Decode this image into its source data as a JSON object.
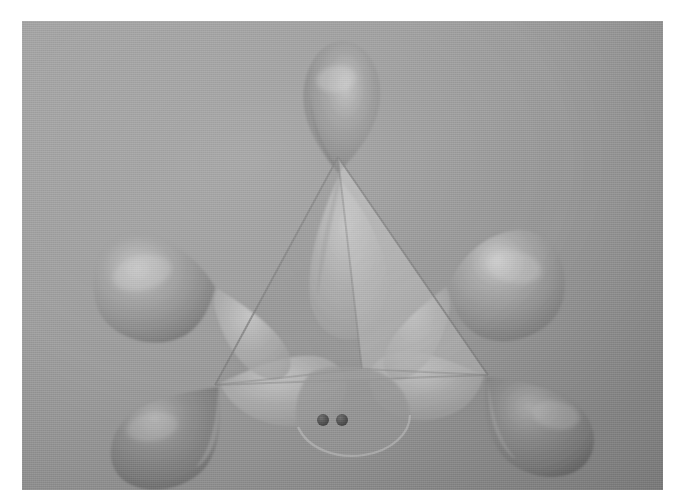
{
  "figure": {
    "alt_description": "Grayscale rendering of four sp3 hybrid orbitals directed toward the corners of a translucent tetrahedron, with a lone pair of electrons shown as two dots in the front lobe",
    "background_color": "#9b9b9b",
    "frame_margin_px": 21,
    "lobe_color": "#8d8d8d",
    "lobe_highlight_color": "#cfcfcf",
    "lobe_shadow_color": "#6f6f6f",
    "tetrahedron_face_color": "#b4b4b4",
    "tetrahedron_edge_color": "#7c7c7c",
    "electron_dot_color": "#4b4b4b",
    "electron_dot_count": 2,
    "lobe_count": 4,
    "back_lobe_count": 4,
    "vertex_count": 4
  },
  "geometry": {
    "label": "tetrahedral",
    "vertices": [
      {
        "name": "apex-top",
        "x": 316,
        "y": 136
      },
      {
        "name": "front-bottom",
        "x": 340,
        "y": 348
      },
      {
        "name": "left-bottom",
        "x": 193,
        "y": 364
      },
      {
        "name": "right-bottom",
        "x": 466,
        "y": 354
      }
    ],
    "lobes": [
      {
        "name": "lobe-top",
        "direction": "up",
        "tip_x": 316,
        "tip_y": 136,
        "far_x": 316,
        "far_y": 20
      },
      {
        "name": "lobe-upper-left",
        "direction": "upper-left",
        "tip_x": 193,
        "tip_y": 264,
        "far_x": 85,
        "far_y": 232
      },
      {
        "name": "lobe-upper-right",
        "direction": "upper-right",
        "tip_x": 425,
        "tip_y": 262,
        "far_x": 527,
        "far_y": 228
      },
      {
        "name": "lobe-lower-left",
        "direction": "lower-left",
        "tip_x": 193,
        "tip_y": 364,
        "far_x": 88,
        "far_y": 420
      },
      {
        "name": "lobe-lower-right",
        "direction": "lower-right",
        "tip_x": 466,
        "tip_y": 354,
        "far_x": 574,
        "far_y": 405
      },
      {
        "name": "lobe-front-lone-pair",
        "direction": "front-down",
        "tip_x": 340,
        "tip_y": 348,
        "far_x": 340,
        "far_y": 445
      }
    ],
    "electron_dots": [
      {
        "name": "electron-dot-left",
        "x": 301,
        "y": 399,
        "r": 6
      },
      {
        "name": "electron-dot-right",
        "x": 320,
        "y": 399,
        "r": 6
      }
    ]
  }
}
